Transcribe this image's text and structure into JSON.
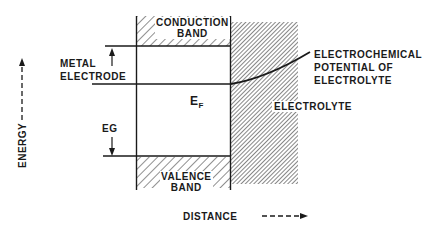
{
  "diagram": {
    "type": "energy band diagram",
    "colors": {
      "ink": "#1a1a1a",
      "background": "#ffffff"
    },
    "labels": {
      "conduction_band_line1": "CONDUCTION",
      "conduction_band_line2": "BAND",
      "valence_band_line1": "VALENCE",
      "valence_band_line2": "BAND",
      "metal_electrode_line1": "METAL",
      "metal_electrode_line2": "ELECTRODE",
      "fermi_level_main": "E",
      "fermi_level_sub": "F",
      "band_gap": "EG",
      "electrochemical_line1": "ELECTROCHEMICAL",
      "electrochemical_line2": "POTENTIAL OF",
      "electrochemical_line3": "ELECTROLYTE",
      "electrolyte": "ELECTROLYTE",
      "energy_axis": "ENERGY",
      "distance_axis": "DISTANCE"
    }
  }
}
